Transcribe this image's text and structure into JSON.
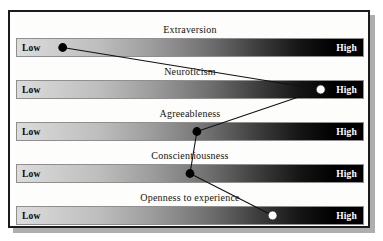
{
  "figure": {
    "anchor_low_label": "Low",
    "anchor_high_label": "High",
    "frame_color": "#1b1b1b",
    "panel_background": "#fdfdfb",
    "gradient_start_color": "#dcdcdc",
    "gradient_end_color": "#000000",
    "marker_dark_color": "#000000",
    "marker_light_color": "#ffffff",
    "line_color": "#111111"
  },
  "chart_data": {
    "type": "line",
    "title": "",
    "xlabel": "",
    "ylabel": "",
    "xlim": [
      0,
      100
    ],
    "grid": false,
    "legend_position": "none",
    "orientation": "horizontal-scales",
    "tick_labels": [
      "Low",
      "High"
    ],
    "categories": [
      "Extraversion",
      "Neuroticism",
      "Agreeableness",
      "Conscientiousness",
      "Openness to experience"
    ],
    "values": [
      13,
      88,
      52,
      50,
      74
    ],
    "series": [
      {
        "name": "Personality profile",
        "values": [
          13,
          88,
          52,
          50,
          74
        ]
      }
    ],
    "points": [
      {
        "trait": "Extraversion",
        "value": 13,
        "marker": "filled"
      },
      {
        "trait": "Neuroticism",
        "value": 88,
        "marker": "open"
      },
      {
        "trait": "Agreeableness",
        "value": 52,
        "marker": "filled"
      },
      {
        "trait": "Conscientiousness",
        "value": 50,
        "marker": "filled"
      },
      {
        "trait": "Openness to experience",
        "value": 74,
        "marker": "open"
      }
    ]
  },
  "rows": [
    {
      "label": "Extraversion",
      "low": "Low",
      "high": "High"
    },
    {
      "label": "Neuroticism",
      "low": "Low",
      "high": "High"
    },
    {
      "label": "Agreeableness",
      "low": "Low",
      "high": "High"
    },
    {
      "label": "Conscientiousness",
      "low": "Low",
      "high": "High"
    },
    {
      "label": "Openness to experience",
      "low": "Low",
      "high": "High"
    }
  ]
}
